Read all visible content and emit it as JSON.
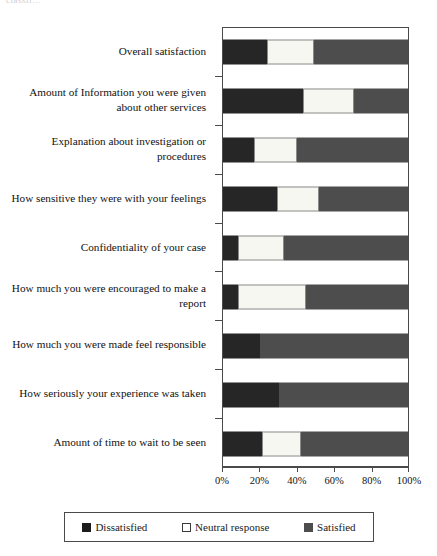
{
  "top_fragment": "classif...",
  "chart_data": {
    "type": "bar",
    "orientation": "horizontal",
    "stacked": true,
    "stack_unit": "percent",
    "title": "",
    "subtitle": "",
    "xlabel": "",
    "ylabel": "",
    "xlim": [
      0,
      100
    ],
    "grid": false,
    "legend_position": "bottom",
    "x_tick_labels": [
      "0%",
      "20%",
      "40%",
      "60%",
      "80%",
      "100%"
    ],
    "x_tick_values": [
      0,
      20,
      40,
      60,
      80,
      100
    ],
    "categories": [
      "Overall satisfaction",
      "Amount of Information you were given about other services",
      "Explanation about investigation or procedures",
      "How sensitive they were with your feelings",
      "Confidentiality of your case",
      "How much you were encouraged to make a report",
      "How much you were made feel responsible",
      "How seriously your experience was taken",
      "Amount of time to wait to be seen"
    ],
    "series": [
      {
        "name": "Dissatisfied",
        "color": "#262626",
        "values": [
          24,
          43,
          17,
          29,
          8,
          8,
          20,
          30,
          21
        ]
      },
      {
        "name": "Neutral response",
        "color": "#f7f7f2",
        "values": [
          25,
          28,
          23,
          23,
          25,
          37,
          0,
          0,
          21
        ]
      },
      {
        "name": "Satisfied",
        "color": "#4d4d4d",
        "values": [
          51,
          29,
          60,
          48,
          67,
          55,
          80,
          70,
          58
        ]
      }
    ]
  }
}
